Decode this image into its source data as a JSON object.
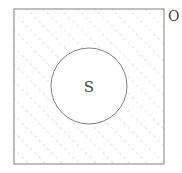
{
  "diagram": {
    "type": "venn",
    "universe": {
      "label": "O",
      "shaded": true
    },
    "sets": [
      {
        "label": "S",
        "shaded": false
      }
    ],
    "colors": {
      "outline": "#808080",
      "hatch": "#c8c8c8",
      "label": "#444444",
      "background": "#ffffff"
    }
  }
}
